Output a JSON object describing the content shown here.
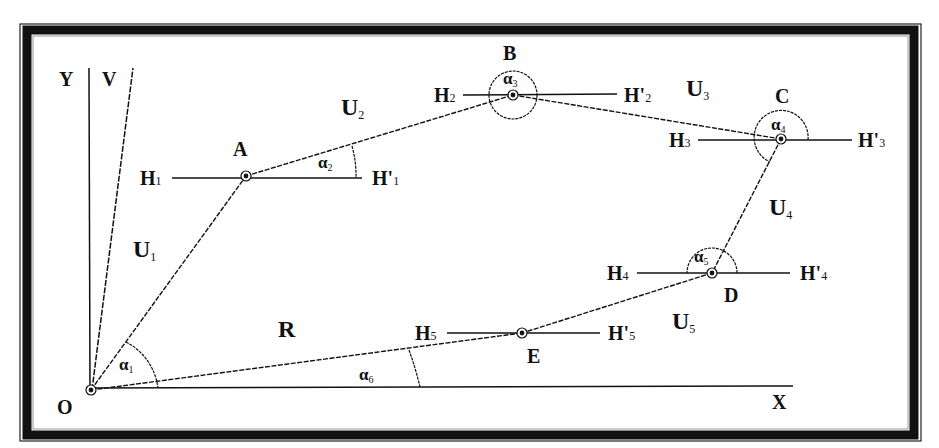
{
  "diagram": {
    "type": "polygon-traverse-geometry",
    "axes": {
      "x_label": "X",
      "y_label": "Y",
      "v_label": "V",
      "origin_label": "O"
    },
    "points": [
      {
        "id": "O",
        "label": "O",
        "x": 91,
        "y": 390
      },
      {
        "id": "A",
        "label": "A",
        "x": 246,
        "y": 176
      },
      {
        "id": "B",
        "label": "B",
        "x": 513,
        "y": 95
      },
      {
        "id": "C",
        "label": "C",
        "x": 781,
        "y": 139
      },
      {
        "id": "D",
        "label": "D",
        "x": 712,
        "y": 273
      },
      {
        "id": "E",
        "label": "E",
        "x": 522,
        "y": 333
      }
    ],
    "segments": [
      {
        "label": "U",
        "sub": "1",
        "from": "O",
        "to": "A"
      },
      {
        "label": "U",
        "sub": "2",
        "from": "A",
        "to": "B"
      },
      {
        "label": "U",
        "sub": "3",
        "from": "B",
        "to": "C"
      },
      {
        "label": "U",
        "sub": "4",
        "from": "C",
        "to": "D"
      },
      {
        "label": "U",
        "sub": "5",
        "from": "D",
        "to": "E"
      },
      {
        "label": "R",
        "sub": "",
        "from": "O",
        "to": "E"
      }
    ],
    "horizontals": [
      {
        "left": "H",
        "left_sub": "1",
        "right": "H'",
        "right_sub": "1",
        "at": "A"
      },
      {
        "left": "H",
        "left_sub": "2",
        "right": "H'",
        "right_sub": "2",
        "at": "B"
      },
      {
        "left": "H",
        "left_sub": "3",
        "right": "H'",
        "right_sub": "3",
        "at": "C"
      },
      {
        "left": "H",
        "left_sub": "4",
        "right": "H'",
        "right_sub": "4",
        "at": "D"
      },
      {
        "left": "H",
        "left_sub": "5",
        "right": "H'",
        "right_sub": "5",
        "at": "E"
      }
    ],
    "angles": [
      {
        "symbol": "α",
        "sub": "1",
        "at": "O"
      },
      {
        "symbol": "α",
        "sub": "2",
        "at": "A"
      },
      {
        "symbol": "α",
        "sub": "3",
        "at": "B"
      },
      {
        "symbol": "α",
        "sub": "4",
        "at": "C"
      },
      {
        "symbol": "α",
        "sub": "5",
        "at": "D"
      },
      {
        "symbol": "α",
        "sub": "6",
        "at": "O"
      }
    ],
    "colors": {
      "line": "#111111",
      "frame": "#111111",
      "background": "#ffffff"
    }
  }
}
